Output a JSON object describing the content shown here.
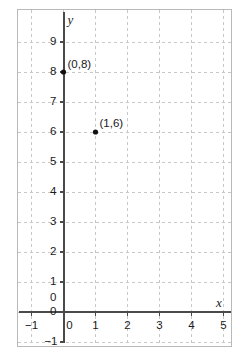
{
  "figure": {
    "kind": "coordinate-plane-scatter",
    "background_color": "#ffffff",
    "frame_color": "#b9b9b9",
    "grid_color": "#c8c8c8",
    "axis_color": "#4a4a4a",
    "point_color": "#111111",
    "text_color": "#1a1a1a"
  },
  "chart_data": {
    "type": "scatter",
    "title": "",
    "xlabel": "x",
    "ylabel": "y",
    "xlim": [
      -1.35,
      5.7
    ],
    "ylim": [
      -1.15,
      9.6
    ],
    "grid": true,
    "legend": null,
    "x_ticks": [
      -1,
      0,
      1,
      2,
      3,
      4,
      5
    ],
    "x_tick_labels": [
      "−1",
      "0",
      "1",
      "2",
      "3",
      "4",
      "5"
    ],
    "y_ticks": [
      -1,
      0,
      1,
      2,
      3,
      4,
      5,
      6,
      7,
      8,
      9
    ],
    "y_tick_labels": [
      "−1",
      "0",
      "1",
      "2",
      "3",
      "4",
      "5",
      "6",
      "7",
      "8",
      "9"
    ],
    "y_axis_visible_labels": [
      "0",
      "1",
      "2",
      "3",
      "4",
      "5",
      "6",
      "7",
      "8",
      "9"
    ],
    "points": [
      {
        "x": 0,
        "y": 8,
        "label": "(0,8)"
      },
      {
        "x": 1,
        "y": 6,
        "label": "(1,6)"
      }
    ],
    "annotations": [
      {
        "text": "(0,8)",
        "anchor_x": 0,
        "anchor_y": 8
      },
      {
        "text": "(1,6)",
        "anchor_x": 1,
        "anchor_y": 6
      }
    ]
  },
  "axis_labels": {
    "x": "x",
    "y": "y"
  },
  "origin": {
    "top_label": "0",
    "bottom_label": "0"
  }
}
